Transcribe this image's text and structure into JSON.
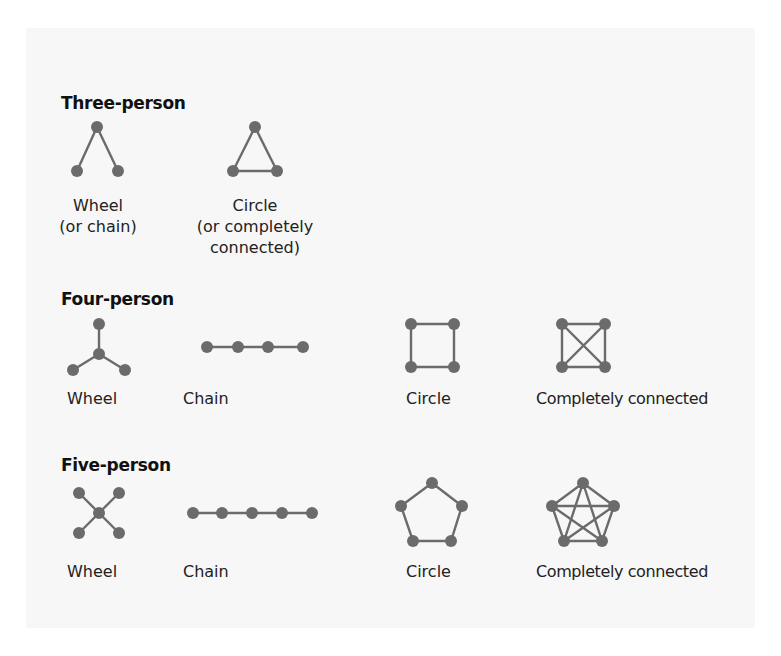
{
  "figure": {
    "sections": [
      {
        "title": "Three-person",
        "networks": [
          {
            "name": "wheel",
            "label_lines": [
              "Wheel",
              "(or chain)"
            ]
          },
          {
            "name": "circle",
            "label_lines": [
              "Circle",
              "(or completely",
              "connected)"
            ]
          }
        ]
      },
      {
        "title": "Four-person",
        "networks": [
          {
            "name": "wheel",
            "label_lines": [
              "Wheel"
            ]
          },
          {
            "name": "chain",
            "label_lines": [
              "Chain"
            ]
          },
          {
            "name": "circle",
            "label_lines": [
              "Circle"
            ]
          },
          {
            "name": "completely-connected",
            "label_lines": [
              "Completely connected"
            ]
          }
        ]
      },
      {
        "title": "Five-person",
        "networks": [
          {
            "name": "wheel",
            "label_lines": [
              "Wheel"
            ]
          },
          {
            "name": "chain",
            "label_lines": [
              "Chain"
            ]
          },
          {
            "name": "circle",
            "label_lines": [
              "Circle"
            ]
          },
          {
            "name": "completely-connected",
            "label_lines": [
              "Completely connected"
            ]
          }
        ]
      }
    ],
    "colors": {
      "node": "#6b6b6b",
      "edge": "#6b6b6b",
      "background": "#f7f7f7",
      "text": "#1a1a1a"
    }
  }
}
